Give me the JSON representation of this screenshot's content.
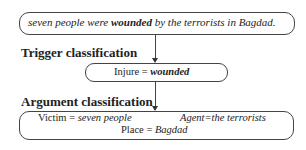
{
  "sentence": {
    "part1": "seven people were ",
    "trigger": "wounded",
    "part2": " by the terrorists in Bagdad."
  },
  "trigger_section": {
    "heading": "Trigger classification",
    "event_type": "Injure",
    "equals": " = ",
    "trigger_word": "wounded"
  },
  "argument_section": {
    "heading": "Argument classification",
    "victim_label": "Victim",
    "victim_eq": " = ",
    "victim_value": "seven people",
    "agent_label": "Agent",
    "agent_eq": "=",
    "agent_value": "the terrorists",
    "place_label": "Place",
    "place_eq": " = ",
    "place_value": "Bagdad"
  }
}
